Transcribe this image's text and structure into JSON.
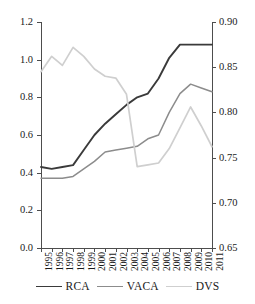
{
  "chart_data": {
    "type": "line",
    "title": "",
    "xlabel": "",
    "ylabel": "",
    "grid": false,
    "legend_position": "bottom",
    "x": [
      1995,
      1996,
      1997,
      1998,
      1999,
      2000,
      2001,
      2002,
      2003,
      2004,
      2005,
      2006,
      2007,
      2008,
      2009,
      2010,
      2011
    ],
    "categories": [
      "1995",
      "1996",
      "1997",
      "1998",
      "1999",
      "2000",
      "2001",
      "2002",
      "2003",
      "2004",
      "2005",
      "2006",
      "2007",
      "2008",
      "2009",
      "2010",
      "2011"
    ],
    "axes": {
      "left": {
        "label": "",
        "ylim": [
          0.0,
          1.2
        ],
        "ticks": [
          0.0,
          0.2,
          0.4,
          0.6,
          0.8,
          1.0,
          1.2
        ],
        "ticklabels": [
          "0.0",
          "0.2",
          "0.4",
          "0.6",
          "0.8",
          "1.0",
          "1.2"
        ]
      },
      "right": {
        "label": "",
        "ylim": [
          0.65,
          0.9
        ],
        "ticks": [
          0.65,
          0.7,
          0.75,
          0.8,
          0.85,
          0.9
        ],
        "ticklabels": [
          "0.65",
          "0.70",
          "0.75",
          "0.80",
          "0.85",
          "0.90"
        ]
      }
    },
    "series": [
      {
        "name": "RCA",
        "axis": "left",
        "color": "#3a3a3a",
        "width": 1.9,
        "values": [
          0.43,
          0.42,
          0.43,
          0.44,
          0.52,
          0.6,
          0.66,
          0.71,
          0.76,
          0.8,
          0.82,
          0.9,
          1.01,
          1.08,
          1.08,
          1.08,
          1.08
        ]
      },
      {
        "name": "VACA",
        "axis": "left",
        "color": "#8c8c8c",
        "width": 1.5,
        "values": [
          0.37,
          0.37,
          0.37,
          0.38,
          0.42,
          0.46,
          0.51,
          0.52,
          0.53,
          0.54,
          0.58,
          0.6,
          0.72,
          0.82,
          0.87,
          0.85,
          0.83
        ]
      },
      {
        "name": "DVS",
        "axis": "right",
        "color": "#cfcfcf",
        "width": 1.7,
        "values": [
          0.845,
          0.862,
          0.852,
          0.872,
          0.862,
          0.848,
          0.84,
          0.838,
          0.82,
          0.74,
          0.742,
          0.744,
          0.76,
          0.783,
          0.806,
          0.785,
          0.762
        ]
      }
    ]
  },
  "legend": {
    "items": [
      {
        "label": "RCA",
        "color": "#3a3a3a"
      },
      {
        "label": "VACA",
        "color": "#8c8c8c"
      },
      {
        "label": "DVS",
        "color": "#cfcfcf"
      }
    ]
  }
}
